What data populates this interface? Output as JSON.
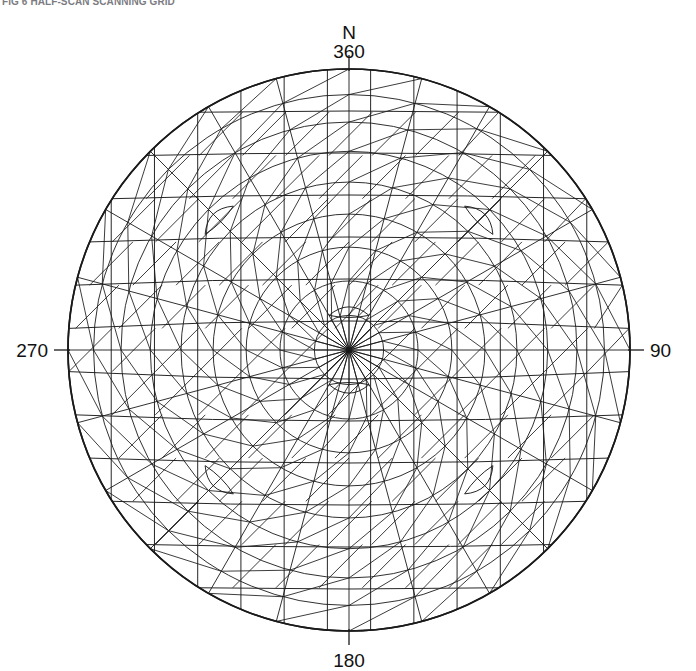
{
  "caption": {
    "text": "FIG 6  HALF-SCAN SCANNING GRID"
  },
  "figure": {
    "name": "azimuthal-projection-net",
    "background_color": "#ffffff",
    "line_color": "#1a1a1a",
    "center": {
      "x": 349,
      "y": 350
    },
    "radius": 281
  },
  "labels": {
    "north_letter": "N",
    "north_bearing": "360",
    "east_bearing": "90",
    "south_bearing": "180",
    "west_bearing": "270"
  },
  "chart_data": {
    "type": "scatter",
    "title": "FIG 6  HALF-SCAN SCANNING GRID",
    "subtitle": "",
    "xlabel": "",
    "ylabel": "",
    "projection": "azimuthal-equal-area",
    "grid": true,
    "legend": null,
    "axis_ticks": [
      {
        "label": "360",
        "bearing_deg": 0,
        "position": "top"
      },
      {
        "label": "90",
        "bearing_deg": 90,
        "position": "right"
      },
      {
        "label": "180",
        "bearing_deg": 180,
        "position": "bottom"
      },
      {
        "label": "270",
        "bearing_deg": 270,
        "position": "left"
      }
    ],
    "azimuth_range_deg": [
      0,
      360
    ],
    "elevation_range_deg": [
      0,
      90
    ],
    "ring_count": 9,
    "meridian_count": 24,
    "mesh": {
      "rings_elevation_deg": [
        0,
        10,
        20,
        30,
        40,
        50,
        60,
        70,
        80,
        90
      ],
      "cell_shape": "triangle",
      "diagonal_bracing": true
    },
    "annotations": [
      {
        "type": "lens",
        "bearing_deg": 0,
        "elevation_deg": 80,
        "note": "pole cell"
      },
      {
        "type": "lens",
        "bearing_deg": 180,
        "elevation_deg": 80,
        "note": "pole cell"
      },
      {
        "type": "lens",
        "bearing_deg": 45,
        "elevation_deg": 35,
        "note": "seam cell"
      },
      {
        "type": "lens",
        "bearing_deg": 135,
        "elevation_deg": 35,
        "note": "seam cell"
      },
      {
        "type": "lens",
        "bearing_deg": 225,
        "elevation_deg": 35,
        "note": "seam cell"
      },
      {
        "type": "lens",
        "bearing_deg": 315,
        "elevation_deg": 35,
        "note": "seam cell"
      }
    ]
  }
}
